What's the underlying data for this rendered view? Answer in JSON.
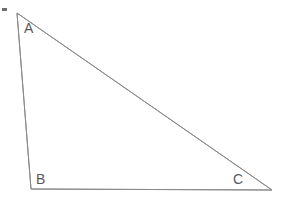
{
  "figure": {
    "name": "triangle-diagram",
    "type": "geometry-diagram",
    "background_color": "#ffffff",
    "width": 283,
    "height": 199,
    "stroke_color": "#8a8a8a",
    "stroke_width": 1,
    "label_color": "#5a5a5a",
    "label_font_size": 14
  },
  "shape": {
    "kind": "triangle",
    "vertices": [
      {
        "id": "A",
        "label": "A",
        "x": 17,
        "y": 13
      },
      {
        "id": "B",
        "label": "B",
        "x": 31,
        "y": 189
      },
      {
        "id": "C",
        "label": "C",
        "x": 272,
        "y": 190
      }
    ],
    "edges": [
      {
        "id": "AB",
        "from": "A",
        "to": "B"
      },
      {
        "id": "BC",
        "from": "B",
        "to": "C"
      },
      {
        "id": "CA",
        "from": "C",
        "to": "A"
      }
    ],
    "path": "M 17 13 L 31 189 L 272 190 Z"
  },
  "labels": {
    "A": "A",
    "B": "B",
    "C": "C"
  },
  "marks": {
    "stray_mark": {
      "name": "stray-mark",
      "color": "#6e6e6e",
      "x": 2,
      "y": 8,
      "width": 5,
      "height": 3
    }
  }
}
